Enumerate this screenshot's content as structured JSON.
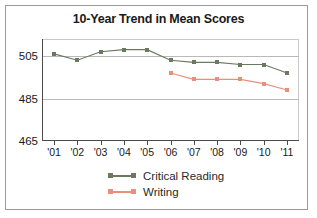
{
  "chart_data": {
    "type": "line",
    "title": "10-Year Trend in Mean Scores",
    "xlabel": "",
    "ylabel": "",
    "x": [
      "'01",
      "'02",
      "'03",
      "'04",
      "'05",
      "'06",
      "'07",
      "'08",
      "'09",
      "'10",
      "'11"
    ],
    "ylim": [
      465,
      513
    ],
    "yticks": [
      465,
      485,
      505
    ],
    "ytick_labels": [
      "465",
      "485",
      "505"
    ],
    "grid": "horizontal",
    "legend_position": "bottom",
    "series": [
      {
        "name": "Critical Reading",
        "color": "#6b7a5e",
        "values": [
          506,
          503,
          507,
          508,
          508,
          503,
          502,
          502,
          501,
          501,
          497
        ]
      },
      {
        "name": "Writing",
        "color": "#e8907c",
        "values": [
          null,
          null,
          null,
          null,
          null,
          497,
          494,
          494,
          494,
          492,
          489
        ]
      }
    ]
  },
  "legend": {
    "items": [
      {
        "label": "Critical Reading",
        "color": "#6b7a5e"
      },
      {
        "label": "Writing",
        "color": "#e8907c"
      }
    ]
  },
  "colors": {
    "critical_reading": "#6b7a5e",
    "writing": "#e8907c",
    "axis": "#4a4a4a",
    "gridline": "#b9b9b9",
    "border": "#9a9a9a",
    "text": "#1a1a1a",
    "background": "#ffffff"
  }
}
